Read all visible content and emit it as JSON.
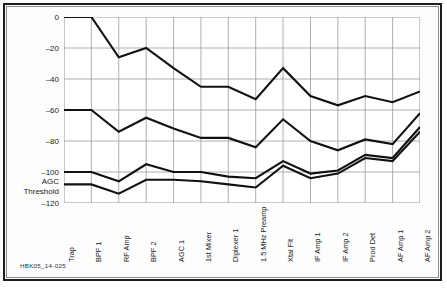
{
  "figure": {
    "caption": "HBK05_14-025",
    "annotation": {
      "line1": "AGC",
      "line2": "Threshold",
      "value": -110
    }
  },
  "chart_data": {
    "type": "line",
    "title": "",
    "xlabel": "",
    "ylabel": "Input Signal Level (dBm)",
    "ylim": [
      -120,
      0
    ],
    "yticks": [
      0,
      -20,
      -40,
      -60,
      -80,
      -100,
      -120
    ],
    "ytick_labels": [
      "0",
      "–20",
      "–40",
      "–60",
      "–80",
      "–100",
      "–120"
    ],
    "grid": true,
    "legend": "none",
    "line_color": "#111111",
    "grid_color": "#9a9a9a",
    "categories": [
      "Trap",
      "BPF 1",
      "RF Amp",
      "BPF 2",
      "AGC 1",
      "1st Mixer",
      "Diplexer 1",
      "1.5 MHz Preamp",
      "Xtal Flt",
      "IF Amp 1",
      "IF Amp 2",
      "Prod Det",
      "AF Amp 1",
      "AF Amp 2"
    ],
    "series": [
      {
        "name": "Maximum signal level",
        "values": [
          0,
          0,
          -26,
          -20,
          -33,
          -45,
          -45,
          -53,
          -33,
          -51,
          -57,
          -51,
          -55,
          -48
        ]
      },
      {
        "name": "Strong signal level",
        "values": [
          -60,
          -60,
          -74,
          -65,
          -72,
          -78,
          -78,
          -84,
          -66,
          -80,
          -86,
          -79,
          -82,
          -62
        ]
      },
      {
        "name": "Minimum discernible signal",
        "values": [
          -100,
          -100,
          -106,
          -95,
          -100,
          -100,
          -103,
          -104,
          -93,
          -101,
          -99,
          -89,
          -91,
          -71
        ]
      },
      {
        "name": "Noise floor",
        "values": [
          -108,
          -108,
          -114,
          -105,
          -105,
          -106,
          -108,
          -110,
          -96,
          -104,
          -101,
          -91,
          -93,
          -74
        ]
      }
    ]
  }
}
